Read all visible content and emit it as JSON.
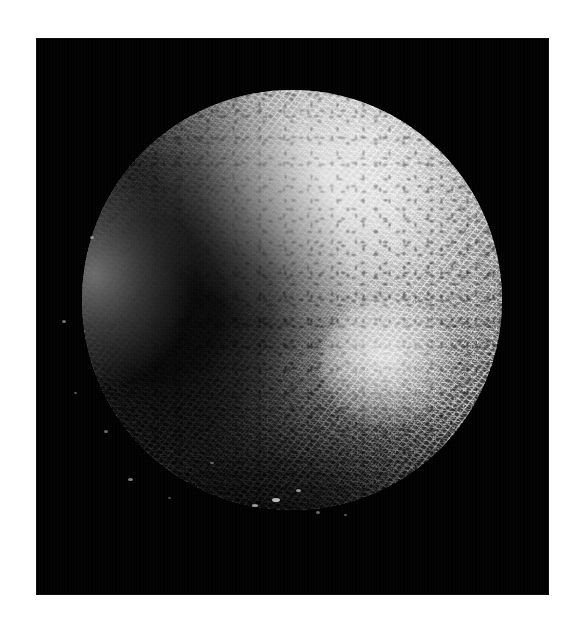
{
  "figure": {
    "domain": "Natural-Image",
    "kind": "scanning-electron-micrograph",
    "caption": "",
    "alt_text": "Scanning electron micrograph of a roughly spherical aggregate densely covered in short rod-shaped filaments, lit from the upper right against a black background.",
    "background_color": "#ffffff",
    "panel_color": "#000000"
  },
  "panel": {
    "label": "micrograph-panel",
    "x": 36,
    "y": 38,
    "width": 513,
    "height": 557,
    "background_color": "#000000"
  },
  "specimen": {
    "label": "spherical-aggregate",
    "shape": "sphere",
    "center_x": 292,
    "center_y": 300,
    "radius": 210,
    "surface_texture": "dense short rod-shaped filaments",
    "tone_highlight": "#e6e6e6",
    "tone_midtone": "#8a8a8a",
    "tone_shadow": "#0a0a0a"
  },
  "lighting": {
    "key_light_direction": "upper-right",
    "terminator_side": "left",
    "rim_light_side": "far-left-limb",
    "specular_lobe": "lower-right quadrant"
  },
  "debris": [
    {
      "x": 62,
      "y": 320,
      "w": 4,
      "h": 3,
      "opacity": 0.55
    },
    {
      "x": 74,
      "y": 392,
      "w": 3,
      "h": 2,
      "opacity": 0.42
    },
    {
      "x": 128,
      "y": 478,
      "w": 5,
      "h": 3,
      "opacity": 0.62
    },
    {
      "x": 168,
      "y": 497,
      "w": 3,
      "h": 2,
      "opacity": 0.38
    },
    {
      "x": 252,
      "y": 504,
      "w": 6,
      "h": 3,
      "opacity": 0.74
    },
    {
      "x": 272,
      "y": 498,
      "w": 8,
      "h": 4,
      "opacity": 0.88
    },
    {
      "x": 296,
      "y": 489,
      "w": 5,
      "h": 3,
      "opacity": 0.7
    },
    {
      "x": 316,
      "y": 511,
      "w": 4,
      "h": 3,
      "opacity": 0.5
    },
    {
      "x": 344,
      "y": 514,
      "w": 3,
      "h": 2,
      "opacity": 0.44
    },
    {
      "x": 210,
      "y": 462,
      "w": 4,
      "h": 2,
      "opacity": 0.46
    },
    {
      "x": 452,
      "y": 236,
      "w": 3,
      "h": 3,
      "opacity": 0.52
    },
    {
      "x": 466,
      "y": 284,
      "w": 3,
      "h": 2,
      "opacity": 0.46
    },
    {
      "x": 90,
      "y": 236,
      "w": 4,
      "h": 3,
      "opacity": 0.58
    },
    {
      "x": 104,
      "y": 430,
      "w": 4,
      "h": 3,
      "opacity": 0.5
    }
  ]
}
